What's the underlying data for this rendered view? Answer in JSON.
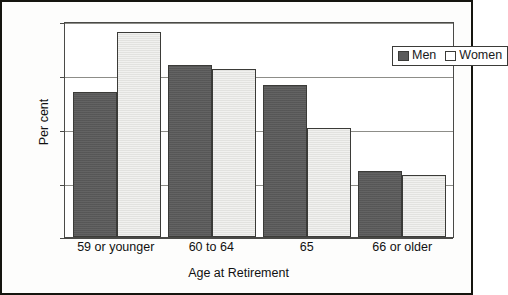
{
  "chart_data": {
    "type": "bar",
    "title": "",
    "xlabel": "Age at Retirement",
    "ylabel": "Per cent",
    "categories": [
      "59 or younger",
      "60 to 64",
      "65",
      "66 or older"
    ],
    "series": [
      {
        "name": "Men",
        "values": [
          27.0,
          32.0,
          28.2,
          12.3
        ],
        "color": "#5b5b5b"
      },
      {
        "name": "Women",
        "values": [
          38.2,
          31.2,
          20.3,
          11.5
        ],
        "color": "#e9e9e6"
      }
    ],
    "ylim": [
      0,
      40
    ],
    "yticks": [
      0,
      10,
      20,
      30,
      40
    ],
    "ytick_labels": [
      "0",
      "10",
      "20",
      "30",
      "40"
    ],
    "grid": true,
    "legend_position": "top-right"
  },
  "legend": {
    "men_label": "Men",
    "women_label": "Women"
  }
}
